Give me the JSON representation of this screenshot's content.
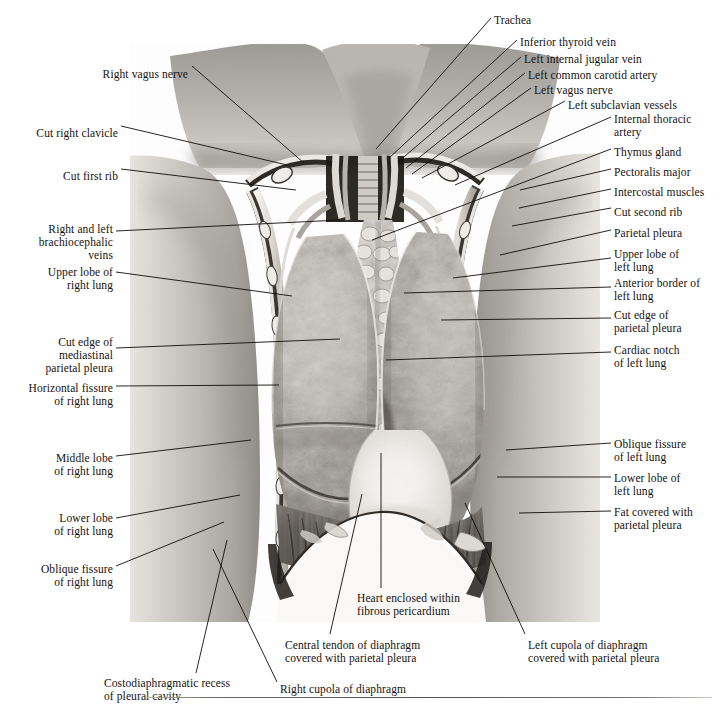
{
  "figure": {
    "modality": "grayscale anatomical photograph with leader-line labels"
  },
  "labels_left": [
    {
      "id": "right-vagus-nerve",
      "text": "Right vagus nerve",
      "x": 188,
      "y": 68,
      "align": "right",
      "line": [
        192,
        66,
        304,
        163
      ]
    },
    {
      "id": "cut-right-clavicle",
      "text": "Cut right clavicle",
      "x": 118,
      "y": 127,
      "align": "right",
      "line": [
        121,
        126,
        287,
        165
      ]
    },
    {
      "id": "cut-first-rib",
      "text": "Cut first rib",
      "x": 118,
      "y": 170,
      "align": "right",
      "line": [
        121,
        169,
        296,
        190
      ]
    },
    {
      "id": "right-and-left-brachiocephalic-veins",
      "text": "Right and left\nbrachiocephalic\nveins",
      "x": 113,
      "y": 223,
      "align": "right",
      "line": [
        116,
        231,
        340,
        220
      ]
    },
    {
      "id": "upper-lobe-of-right-lung",
      "text": "Upper lobe of\nright lung",
      "x": 113,
      "y": 266,
      "align": "right",
      "line": [
        116,
        272,
        292,
        296
      ]
    },
    {
      "id": "cut-edge-of-mediastinal-parietal-pleura",
      "text": "Cut edge of\nmediastinal\nparietal pleura",
      "x": 113,
      "y": 336,
      "align": "right",
      "line": [
        116,
        348,
        340,
        339
      ]
    },
    {
      "id": "horizontal-fissure-of-right-lung",
      "text": "Horizontal fissure\nof right lung",
      "x": 113,
      "y": 382,
      "align": "right",
      "line": [
        116,
        386,
        279,
        385
      ]
    },
    {
      "id": "middle-lobe-of-right-lung",
      "text": "Middle lobe\nof right lung",
      "x": 113,
      "y": 452,
      "align": "right",
      "line": [
        116,
        456,
        251,
        440
      ]
    },
    {
      "id": "lower-lobe-of-right-lung",
      "text": "Lower lobe\nof right lung",
      "x": 113,
      "y": 512,
      "align": "right",
      "line": [
        116,
        518,
        240,
        495
      ]
    },
    {
      "id": "oblique-fissure-of-right-lung",
      "text": "Oblique fissure\nof right lung",
      "x": 113,
      "y": 563,
      "align": "right",
      "line": [
        116,
        566,
        224,
        522
      ]
    }
  ],
  "labels_right": [
    {
      "id": "trachea",
      "text": "Trachea",
      "x": 494,
      "y": 14,
      "align": "left",
      "line": [
        491,
        18,
        376,
        149
      ]
    },
    {
      "id": "inferior-thyroid-vein",
      "text": "Inferior thyroid vein",
      "x": 520,
      "y": 36,
      "align": "left",
      "line": [
        517,
        40,
        389,
        158
      ]
    },
    {
      "id": "left-internal-jugular-vein",
      "text": "Left internal jugular vein",
      "x": 524,
      "y": 53,
      "align": "left",
      "line": [
        521,
        57,
        398,
        162
      ]
    },
    {
      "id": "left-common-carotid-artery",
      "text": "Left common carotid artery",
      "x": 528,
      "y": 69,
      "align": "left",
      "line": [
        525,
        73,
        406,
        168
      ]
    },
    {
      "id": "left-vagus-nerve",
      "text": "Left vagus nerve",
      "x": 534,
      "y": 84,
      "align": "left",
      "line": [
        531,
        88,
        412,
        174
      ]
    },
    {
      "id": "left-subclavian-vessels",
      "text": "Left subclavian vessels",
      "x": 568,
      "y": 99,
      "align": "left",
      "line": [
        565,
        101,
        422,
        178
      ]
    },
    {
      "id": "internal-thoracic-artery",
      "text": "Internal thoracic\nartery",
      "x": 614,
      "y": 113,
      "align": "left",
      "line": [
        611,
        117,
        455,
        185
      ]
    },
    {
      "id": "thymus-gland",
      "text": "Thymus gland",
      "x": 614,
      "y": 146,
      "align": "left",
      "line": [
        611,
        149,
        372,
        240
      ]
    },
    {
      "id": "pectoralis-major",
      "text": "Pectoralis major",
      "x": 614,
      "y": 166,
      "align": "left",
      "line": [
        611,
        169,
        520,
        190
      ]
    },
    {
      "id": "intercostal-muscles",
      "text": "Intercostal muscles",
      "x": 614,
      "y": 186,
      "align": "left",
      "line": [
        611,
        189,
        519,
        208
      ]
    },
    {
      "id": "cut-second-rib",
      "text": "Cut second rib",
      "x": 614,
      "y": 206,
      "align": "left",
      "line": [
        611,
        208,
        512,
        226
      ]
    },
    {
      "id": "parietal-pleura",
      "text": "Parietal pleura",
      "x": 614,
      "y": 227,
      "align": "left",
      "line": [
        611,
        230,
        500,
        255
      ]
    },
    {
      "id": "upper-lobe-of-left-lung",
      "text": "Upper lobe of\nleft lung",
      "x": 614,
      "y": 248,
      "align": "left",
      "line": [
        611,
        258,
        453,
        278
      ]
    },
    {
      "id": "anterior-border-of-left-lung",
      "text": "Anterior border of\nleft lung",
      "x": 614,
      "y": 277,
      "align": "left",
      "line": [
        611,
        287,
        404,
        293
      ]
    },
    {
      "id": "cut-edge-of-parietal-pleura",
      "text": "Cut edge of\nparietal pleura",
      "x": 614,
      "y": 309,
      "align": "left",
      "line": [
        611,
        318,
        441,
        320
      ]
    },
    {
      "id": "cardiac-notch-of-left-lung",
      "text": "Cardiac notch\nof left lung",
      "x": 614,
      "y": 344,
      "align": "left",
      "line": [
        611,
        352,
        386,
        360
      ]
    },
    {
      "id": "oblique-fissure-of-left-lung",
      "text": "Oblique fissure\nof left lung",
      "x": 614,
      "y": 438,
      "align": "left",
      "line": [
        611,
        443,
        506,
        450
      ]
    },
    {
      "id": "lower-lobe-of-left-lung",
      "text": "Lower lobe of\nleft lung",
      "x": 614,
      "y": 472,
      "align": "left",
      "line": [
        611,
        477,
        497,
        477
      ]
    },
    {
      "id": "fat-covered-with-parietal-pleura",
      "text": "Fat covered with\nparietal pleura",
      "x": 614,
      "y": 506,
      "align": "left",
      "line": [
        611,
        511,
        519,
        513
      ]
    }
  ],
  "labels_bottom": [
    {
      "id": "heart-enclosed-within-fibrous-pericardium",
      "text": "Heart enclosed within\nfibrous pericardium",
      "x": 357,
      "y": 592,
      "align": "left",
      "line": [
        381,
        588,
        381,
        453
      ]
    },
    {
      "id": "central-tendon-of-diaphragm",
      "text": "Central tendon of diaphragm\ncovered with parietal pleura",
      "x": 285,
      "y": 639,
      "align": "left",
      "line": [
        330,
        634,
        362,
        494
      ]
    },
    {
      "id": "left-cupola-of-diaphragm",
      "text": "Left cupola of diaphragm\ncovered with parietal pleura",
      "x": 528,
      "y": 639,
      "align": "left",
      "line": [
        525,
        634,
        465,
        503
      ]
    },
    {
      "id": "right-cupola-of-diaphragm",
      "text": "Right cupola of diaphragm",
      "x": 280,
      "y": 683,
      "align": "left",
      "line": [
        277,
        682,
        213,
        549
      ]
    },
    {
      "id": "costodiaphragmatic-recess-of-pleural-cavity",
      "text": "Costodiaphragmatic recess\nof pleural cavity",
      "x": 104,
      "y": 677,
      "align": "left",
      "line": [
        196,
        673,
        227,
        540
      ]
    }
  ],
  "rule": {
    "present": true
  }
}
